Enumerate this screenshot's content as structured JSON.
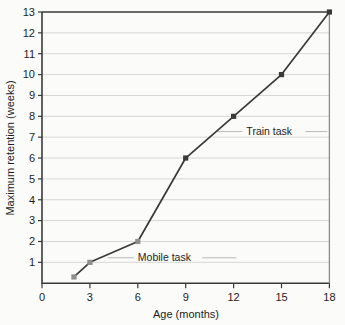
{
  "chart_data": {
    "type": "line",
    "title": "",
    "xlabel": "Age (months)",
    "ylabel": "Maximum retention (weeks)",
    "xlim": [
      0,
      18
    ],
    "ylim": [
      0,
      13
    ],
    "xticks": [
      "0",
      "3",
      "6",
      "9",
      "12",
      "15",
      "18"
    ],
    "xtick_values": [
      0,
      3,
      6,
      9,
      12,
      15,
      18
    ],
    "yticks": [
      "1",
      "2",
      "3",
      "4",
      "5",
      "6",
      "7",
      "8",
      "9",
      "10",
      "11",
      "12",
      "13"
    ],
    "ytick_values": [
      1,
      2,
      3,
      4,
      5,
      6,
      7,
      8,
      9,
      10,
      11,
      12,
      13
    ],
    "grid": "horizontal",
    "legend": "none",
    "series": [
      {
        "name": "Maximum retention",
        "x": [
          2,
          3,
          6,
          9,
          12,
          15,
          18
        ],
        "values": [
          0.3,
          1,
          2,
          6,
          8,
          10,
          13
        ],
        "marker": "square",
        "color": "#3a3a3a"
      }
    ],
    "annotations": [
      {
        "label": "Mobile task",
        "x": 6,
        "y": 1.05,
        "points_to": [
          6,
          2
        ]
      },
      {
        "label": "Train task",
        "x": 12.8,
        "y": 7.1,
        "points_to": [
          12,
          8
        ]
      }
    ]
  },
  "colors": {
    "background": "#fbfbfa",
    "axis": "#3a3a3a",
    "gridline": "#d6d6d6",
    "series": "#3a3a3a",
    "text": "#1d1d1d",
    "leader": "#b9b9b9"
  }
}
